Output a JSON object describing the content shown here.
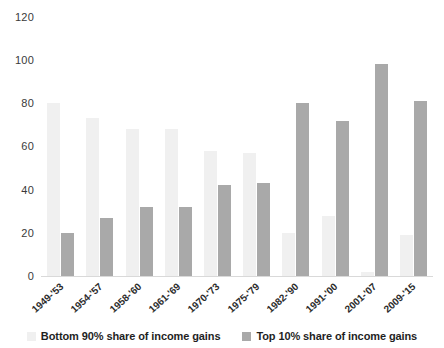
{
  "chart_data": {
    "type": "bar",
    "title": "",
    "subtitle": "",
    "xlabel": "",
    "ylabel": "",
    "ylim": [
      0,
      120
    ],
    "yticks": [
      0,
      20,
      40,
      60,
      80,
      100,
      120
    ],
    "grid": false,
    "legend_position": "bottom",
    "categories": [
      "1949-'53",
      "1954-'57",
      "1958-'60",
      "1961-'69",
      "1970-'73",
      "1975-'79",
      "1982-'90",
      "1991-'00",
      "2001-'07",
      "2009-'15"
    ],
    "series": [
      {
        "name": "Bottom 90% share of income gains",
        "color": "#f0f0f0",
        "values": [
          80,
          73,
          68,
          68,
          58,
          57,
          20,
          28,
          2,
          19
        ]
      },
      {
        "name": "Top 10% share of income gains",
        "color": "#a9a9a9",
        "values": [
          20,
          27,
          32,
          32,
          42,
          43,
          80,
          72,
          98,
          81
        ]
      }
    ]
  },
  "legend": {
    "items": [
      {
        "label": "Bottom 90% share of income gains",
        "swatch": "bottom90"
      },
      {
        "label": "Top 10% share of income gains",
        "swatch": "top10"
      }
    ]
  },
  "axis": {
    "y_tick_labels": [
      "120",
      "100",
      "80",
      "60",
      "40",
      "20",
      "0"
    ]
  }
}
